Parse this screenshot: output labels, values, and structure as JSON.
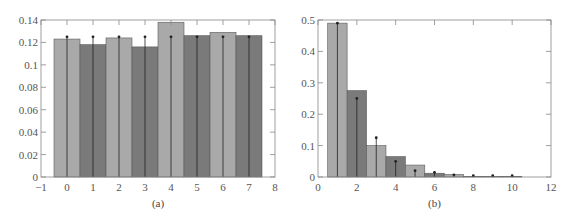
{
  "chart_data": [
    {
      "type": "bar",
      "caption": "(a)",
      "title": "",
      "xlabel": "",
      "ylabel": "",
      "xlim": [
        -1,
        8
      ],
      "ylim": [
        0,
        0.14
      ],
      "x_ticks": [
        "-1",
        "0",
        "1",
        "2",
        "3",
        "4",
        "5",
        "6",
        "7",
        "8"
      ],
      "y_ticks": [
        "0",
        "0.02",
        "0.04",
        "0.06",
        "0.08",
        "0.1",
        "0.12",
        "0.14"
      ],
      "grid": false,
      "categories": [
        0,
        1,
        2,
        3,
        4,
        5,
        6,
        7
      ],
      "series": [
        {
          "name": "empirical histogram",
          "style": "bars (alternating light/dark gray)",
          "values": [
            0.123,
            0.118,
            0.124,
            0.116,
            0.138,
            0.126,
            0.129,
            0.126
          ]
        },
        {
          "name": "theoretical pmf",
          "style": "stem",
          "values": [
            0.125,
            0.125,
            0.125,
            0.125,
            0.125,
            0.125,
            0.125,
            0.125
          ]
        }
      ]
    },
    {
      "type": "bar",
      "caption": "(b)",
      "title": "",
      "xlabel": "",
      "ylabel": "",
      "xlim": [
        0,
        12
      ],
      "ylim": [
        0,
        0.5
      ],
      "x_ticks": [
        "0",
        "2",
        "4",
        "6",
        "8",
        "10",
        "12"
      ],
      "y_ticks": [
        "0",
        "0.1",
        "0.2",
        "0.3",
        "0.4",
        "0.5"
      ],
      "grid": false,
      "categories": [
        1,
        2,
        3,
        4,
        5,
        6,
        7,
        8,
        9,
        10
      ],
      "series": [
        {
          "name": "empirical histogram",
          "style": "bars (alternating light/dark gray)",
          "values": [
            0.49,
            0.275,
            0.1,
            0.065,
            0.038,
            0.012,
            0.008,
            0.002,
            0.002,
            0.002
          ]
        },
        {
          "name": "theoretical pmf",
          "style": "stem",
          "values": [
            0.49,
            0.25,
            0.125,
            0.05,
            0.02,
            0.015,
            0.007,
            0.004,
            0.004,
            0.004
          ]
        }
      ]
    }
  ],
  "colors": {
    "bar_light": "#a9a9a9",
    "bar_dark": "#7a7a7a",
    "axis": "#888888",
    "stem": "#222222"
  }
}
